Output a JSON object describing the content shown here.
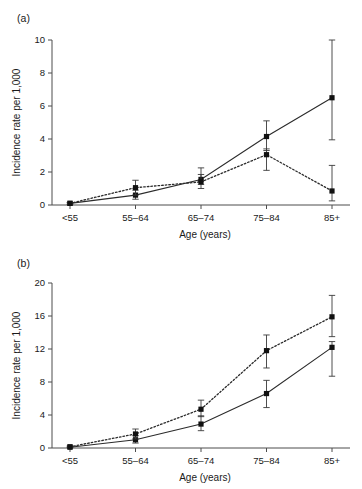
{
  "figure": {
    "background": "#ffffff",
    "ink_color": "#1a1a1a"
  },
  "panels": [
    {
      "id": "a",
      "label": "(a)",
      "xlabel": "Age (years)",
      "ylabel": "Incidence rate per 1,000"
    },
    {
      "id": "b",
      "label": "(b)",
      "xlabel": "Age (years)",
      "ylabel": "Incidence rate per 1,000"
    }
  ],
  "chart_data": [
    {
      "type": "line",
      "panel": "a",
      "title": "(a)",
      "xlabel": "Age (years)",
      "ylabel": "Incidence rate per 1,000",
      "categories": [
        "<55",
        "55–64",
        "65–74",
        "75–84",
        "85+"
      ],
      "ylim": [
        0,
        10
      ],
      "yticks": [
        0,
        2,
        4,
        6,
        8,
        10
      ],
      "ytick_labels": [
        "0",
        "2",
        "4",
        "6",
        "8",
        "10"
      ],
      "grid": false,
      "legend": "none",
      "series": [
        {
          "name": "solid-line-series",
          "style": "solid",
          "marker": "filled-square",
          "values": [
            0.1,
            0.6,
            1.55,
            4.15,
            6.5
          ],
          "error_low": [
            0.05,
            0.35,
            1.25,
            3.3,
            3.95
          ],
          "error_high": [
            0.15,
            0.9,
            1.85,
            5.1,
            10.0
          ]
        },
        {
          "name": "dotted-line-series",
          "style": "dotted",
          "marker": "filled-square",
          "values": [
            0.1,
            1.05,
            1.4,
            3.05,
            0.85
          ],
          "error_low": [
            0.05,
            0.6,
            1.0,
            2.1,
            0.25
          ],
          "error_high": [
            0.15,
            1.5,
            2.25,
            3.4,
            2.4
          ]
        }
      ]
    },
    {
      "type": "line",
      "panel": "b",
      "title": "(b)",
      "xlabel": "Age (years)",
      "ylabel": "Incidence rate per 1,000",
      "categories": [
        "<55",
        "55–64",
        "65–74",
        "75–84",
        "85+"
      ],
      "ylim": [
        0,
        20
      ],
      "yticks": [
        0,
        4,
        8,
        12,
        16,
        20
      ],
      "ytick_labels": [
        "0",
        "4",
        "8",
        "12",
        "16",
        "20"
      ],
      "grid": false,
      "legend": "none",
      "series": [
        {
          "name": "solid-line-series",
          "style": "solid",
          "marker": "filled-square",
          "values": [
            0.1,
            1.0,
            2.9,
            6.6,
            12.2
          ],
          "error_low": [
            0.05,
            0.6,
            2.1,
            4.9,
            8.7
          ],
          "error_high": [
            0.2,
            1.5,
            3.9,
            8.2,
            12.9
          ]
        },
        {
          "name": "dotted-line-series",
          "style": "dotted",
          "marker": "filled-square",
          "values": [
            0.15,
            1.7,
            4.7,
            11.8,
            15.9
          ],
          "error_low": [
            0.05,
            1.1,
            3.8,
            9.7,
            13.5
          ],
          "error_high": [
            0.25,
            2.3,
            5.8,
            13.7,
            18.5
          ]
        }
      ]
    }
  ]
}
